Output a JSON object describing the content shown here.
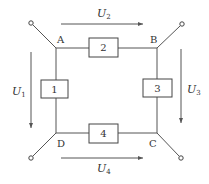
{
  "diagram": {
    "type": "circuit",
    "nodes": [
      {
        "id": "A",
        "label": "A"
      },
      {
        "id": "B",
        "label": "B"
      },
      {
        "id": "C",
        "label": "C"
      },
      {
        "id": "D",
        "label": "D"
      }
    ],
    "elements": [
      {
        "id": "1",
        "label": "1",
        "between": [
          "A",
          "D"
        ]
      },
      {
        "id": "2",
        "label": "2",
        "between": [
          "A",
          "B"
        ]
      },
      {
        "id": "3",
        "label": "3",
        "between": [
          "B",
          "C"
        ]
      },
      {
        "id": "4",
        "label": "4",
        "between": [
          "D",
          "C"
        ]
      }
    ],
    "voltages": [
      {
        "id": "U1",
        "symbol": "U",
        "subscript": "1",
        "direction": "down",
        "element": "1"
      },
      {
        "id": "U2",
        "symbol": "U",
        "subscript": "2",
        "direction": "right",
        "element": "2"
      },
      {
        "id": "U3",
        "symbol": "U",
        "subscript": "3",
        "direction": "down",
        "element": "3"
      },
      {
        "id": "U4",
        "symbol": "U",
        "subscript": "4",
        "direction": "right",
        "element": "4"
      }
    ],
    "terminals": [
      "A",
      "B",
      "C",
      "D"
    ],
    "colors": {
      "line": "#555555",
      "text": "#333333",
      "background": "#ffffff"
    }
  }
}
